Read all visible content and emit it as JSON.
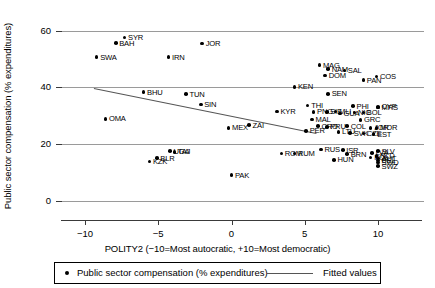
{
  "chart_data": {
    "type": "scatter",
    "title": "",
    "xlabel": "POLITY2 (−10=Most autocratic, +10=Most democratic)",
    "ylabel": "Public sector compensation (% expenditures)",
    "xlim": [
      -11.5,
      11.5
    ],
    "ylim": [
      -2,
      63
    ],
    "xticks": [
      -10,
      -5,
      0,
      5,
      10
    ],
    "xticklabels": [
      "−10",
      "−5",
      "0",
      "5",
      "10"
    ],
    "yticks": [
      0,
      20,
      40,
      60
    ],
    "yticklabels": [
      "0",
      "20",
      "40",
      "60"
    ],
    "grid": "horizontal",
    "legend": {
      "position": "bottom",
      "entries": [
        {
          "marker": "dot",
          "label": "Public sector compensation (% expenditures)"
        },
        {
          "marker": "line",
          "label": "Fitted values"
        }
      ]
    },
    "fit": {
      "name": "Fitted values",
      "x0": -9.4,
      "y0": 39.8,
      "x1": 5.8,
      "y1": 24.0
    },
    "points": [
      {
        "label": "SYR",
        "x": -7.3,
        "y": 57.6
      },
      {
        "label": "BAH",
        "x": -7.9,
        "y": 55.6
      },
      {
        "label": "JOR",
        "x": -2.0,
        "y": 55.4
      },
      {
        "label": "SWA",
        "x": -9.2,
        "y": 50.6
      },
      {
        "label": "IRN",
        "x": -4.3,
        "y": 50.6
      },
      {
        "label": "MAG",
        "x": 6.0,
        "y": 47.8
      },
      {
        "label": "NAM",
        "x": 6.6,
        "y": 46.4
      },
      {
        "label": "SAL",
        "x": 7.7,
        "y": 46.0
      },
      {
        "label": "DOM",
        "x": 6.4,
        "y": 44.2
      },
      {
        "label": "COS",
        "x": 9.9,
        "y": 43.8
      },
      {
        "label": "PAN",
        "x": 9.0,
        "y": 42.6
      },
      {
        "label": "KEN",
        "x": 4.3,
        "y": 40.2
      },
      {
        "label": "BHU",
        "x": -6.0,
        "y": 38.4
      },
      {
        "label": "TUN",
        "x": -3.1,
        "y": 37.6
      },
      {
        "label": "SEN",
        "x": 6.6,
        "y": 37.8
      },
      {
        "label": "SIN",
        "x": -2.1,
        "y": 34.0
      },
      {
        "label": "THI",
        "x": 5.2,
        "y": 33.6
      },
      {
        "label": "PHI",
        "x": 8.3,
        "y": 33.4
      },
      {
        "label": "CYP",
        "x": 10.0,
        "y": 33.2
      },
      {
        "label": "MRS",
        "x": 10.0,
        "y": 33.0
      },
      {
        "label": "KYR",
        "x": 3.1,
        "y": 31.6
      },
      {
        "label": "PNG",
        "x": 5.6,
        "y": 31.4
      },
      {
        "label": "SIE",
        "x": 6.5,
        "y": 31.4
      },
      {
        "label": "MLI",
        "x": 7.1,
        "y": 31.6
      },
      {
        "label": "GUA",
        "x": 7.4,
        "y": 30.8
      },
      {
        "label": "NIC",
        "x": 8.4,
        "y": 31.2
      },
      {
        "label": "BOL",
        "x": 9.0,
        "y": 31.2
      },
      {
        "label": "MAL",
        "x": 5.5,
        "y": 28.8
      },
      {
        "label": "GRC",
        "x": 8.8,
        "y": 28.6
      },
      {
        "label": "ZAI",
        "x": 1.2,
        "y": 26.8
      },
      {
        "label": "MEX",
        "x": -0.2,
        "y": 25.8
      },
      {
        "label": "OMA",
        "x": -8.6,
        "y": 29.0
      },
      {
        "label": "CRO",
        "x": 5.9,
        "y": 26.4
      },
      {
        "label": "PRU",
        "x": 6.5,
        "y": 26.2
      },
      {
        "label": "COL",
        "x": 7.9,
        "y": 26.4
      },
      {
        "label": "JOR2",
        "x": 9.5,
        "y": 25.8
      },
      {
        "label": "MOR",
        "x": 9.9,
        "y": 25.8
      },
      {
        "label": "PER",
        "x": 5.1,
        "y": 24.8
      },
      {
        "label": "LTU",
        "x": 7.3,
        "y": 24.4
      },
      {
        "label": "SVK",
        "x": 8.1,
        "y": 24.0
      },
      {
        "label": "CZE",
        "x": 9.0,
        "y": 23.8
      },
      {
        "label": "EST",
        "x": 9.7,
        "y": 23.6
      },
      {
        "label": "UGA",
        "x": -4.2,
        "y": 17.6
      },
      {
        "label": "TAJ",
        "x": -3.9,
        "y": 17.4
      },
      {
        "label": "BLR",
        "x": -5.1,
        "y": 15.2
      },
      {
        "label": "KZK",
        "x": -5.6,
        "y": 14.0
      },
      {
        "label": "ROM",
        "x": 3.4,
        "y": 16.8
      },
      {
        "label": "RUM",
        "x": 4.3,
        "y": 16.8
      },
      {
        "label": "RUS",
        "x": 6.1,
        "y": 18.2
      },
      {
        "label": "ISR",
        "x": 7.6,
        "y": 18.0
      },
      {
        "label": "BRN",
        "x": 7.9,
        "y": 16.6
      },
      {
        "label": "HUN",
        "x": 7.0,
        "y": 14.6
      },
      {
        "label": "LVA",
        "x": 9.6,
        "y": 17.0
      },
      {
        "label": "SLV",
        "x": 10.0,
        "y": 17.6
      },
      {
        "label": "NLD",
        "x": 9.9,
        "y": 16.0
      },
      {
        "label": "POL",
        "x": 9.5,
        "y": 15.4
      },
      {
        "label": "AUT",
        "x": 10.0,
        "y": 15.0
      },
      {
        "label": "BEL",
        "x": 10.0,
        "y": 14.4
      },
      {
        "label": "SWD",
        "x": 10.0,
        "y": 13.6
      },
      {
        "label": "SWZ",
        "x": 10.0,
        "y": 12.4
      },
      {
        "label": "PAK",
        "x": 0.0,
        "y": 9.2
      }
    ]
  }
}
